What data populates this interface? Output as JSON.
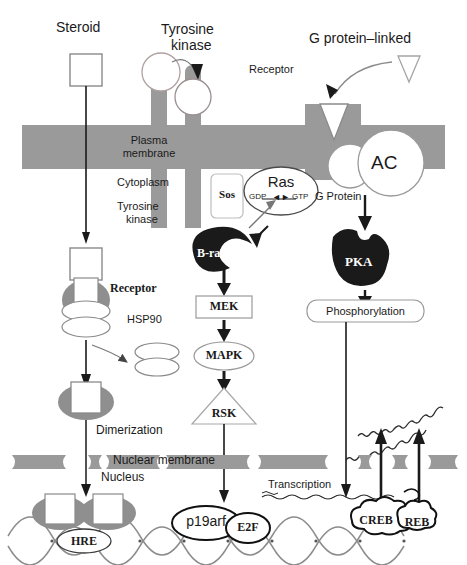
{
  "figure": {
    "colors": {
      "membrane_gray": "#9a9a9a",
      "receptor_gray": "#8f8f8f",
      "dark_protein": "#1a1a1a",
      "outline": "#666666",
      "text": "#1a1a1a",
      "background": "#ffffff",
      "dna_strand": "#8c8c8c"
    }
  },
  "top_labels": {
    "steroid": "Steroid",
    "tyrosine_kinase_line1": "Tyrosine",
    "tyrosine_kinase_line2": "kinase",
    "g_protein_linked": "G protein–linked",
    "receptor": "Receptor"
  },
  "membrane_labels": {
    "plasma_membrane_line1": "Plasma",
    "plasma_membrane_line2": "membrane",
    "cytoplasm": "Cytoplasm",
    "tyrosine_kinase_line1": "Tyrosine",
    "tyrosine_kinase_line2": "kinase",
    "g_protein": "G Protein",
    "ac": "AC"
  },
  "left_branch": {
    "receptor": "Receptor",
    "hsp90": "HSP90",
    "dimerization": "Dimerization",
    "hre": "HRE"
  },
  "middle_branch": {
    "sos": "Sos",
    "ras": "Ras",
    "ras_gdp": "GDP",
    "ras_exchange": "◄►",
    "ras_gtp": "GTP",
    "braf": "B-raf",
    "mek": "MEK",
    "mapk": "MAPK",
    "rsk": "RSK",
    "p19arf": "p19arf",
    "e2f": "E2F"
  },
  "right_branch": {
    "pka": "PKA",
    "phosphorylation": "Phosphorylation",
    "creb_1": "CREB",
    "creb_2": "REB"
  },
  "nucleus_labels": {
    "nuclear_membrane": "Nuclear membrane",
    "nucleus": "Nucleus",
    "transcription": "Transcription"
  }
}
